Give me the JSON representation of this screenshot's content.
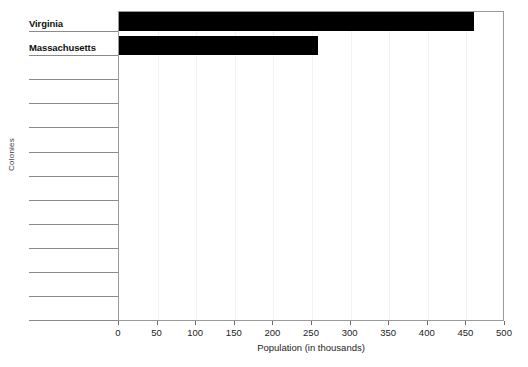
{
  "chart_data": {
    "type": "bar",
    "orientation": "horizontal",
    "title": "",
    "xlabel": "Population (in thousands)",
    "ylabel": "Colonies",
    "xlim": [
      0,
      500
    ],
    "xticks": [
      0,
      50,
      100,
      150,
      200,
      250,
      300,
      350,
      400,
      450,
      500
    ],
    "xtick_labels": [
      "0",
      "50",
      "100",
      "150",
      "200",
      "250",
      "300",
      "350",
      "400",
      "450",
      "500"
    ],
    "grid": true,
    "grid_axis": "x",
    "legend": false,
    "bar_color": "#000000",
    "total_category_slots": 13,
    "categories": [
      "Virginia",
      "Massachusetts",
      "",
      "",
      "",
      "",
      "",
      "",
      "",
      "",
      "",
      "",
      ""
    ],
    "values": [
      460,
      258,
      null,
      null,
      null,
      null,
      null,
      null,
      null,
      null,
      null,
      null,
      null
    ],
    "bars": [
      {
        "category": "Virginia",
        "value": 460
      },
      {
        "category": "Massachusetts",
        "value": 258
      }
    ]
  },
  "axes": {
    "x_title": "Population (in thousands)",
    "y_title": "Colonies"
  },
  "labels": {
    "rows": [
      {
        "text": "Virginia",
        "filled": true
      },
      {
        "text": "Massachusetts",
        "filled": true
      },
      {
        "text": "",
        "filled": false
      },
      {
        "text": "",
        "filled": false
      },
      {
        "text": "",
        "filled": false
      },
      {
        "text": "",
        "filled": false
      },
      {
        "text": "",
        "filled": false
      },
      {
        "text": "",
        "filled": false
      },
      {
        "text": "",
        "filled": false
      },
      {
        "text": "",
        "filled": false
      },
      {
        "text": "",
        "filled": false
      },
      {
        "text": "",
        "filled": false
      },
      {
        "text": "",
        "filled": false
      }
    ]
  },
  "title_sliver": {
    "text": ""
  }
}
